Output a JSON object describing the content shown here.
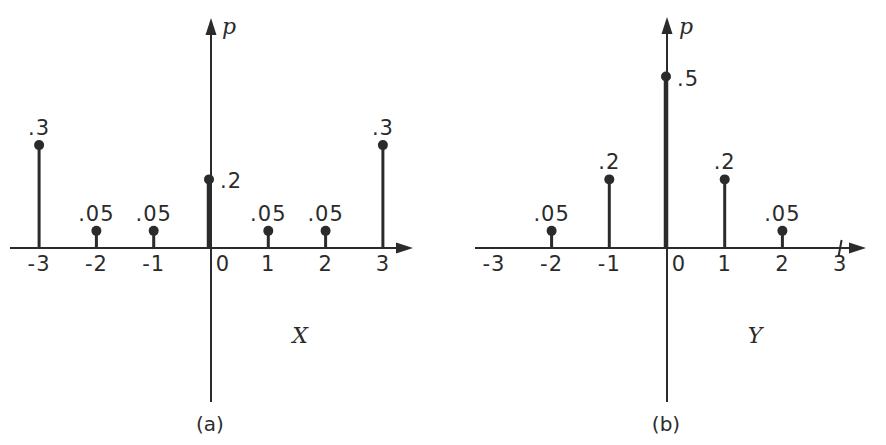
{
  "colors": {
    "ink": "#2b2b2b",
    "background": "#ffffff"
  },
  "chart_data": [
    {
      "type": "stem",
      "panel_caption": "(a)",
      "title": "",
      "xlabel": "X",
      "ylabel": "p",
      "x": [
        -3,
        -2,
        -1,
        0,
        1,
        2,
        3
      ],
      "p": [
        0.3,
        0.05,
        0.05,
        0.2,
        0.05,
        0.05,
        0.3
      ],
      "point_labels": [
        ".3",
        ".05",
        ".05",
        ".2",
        ".05",
        ".05",
        ".3"
      ],
      "x_tick_labels": [
        "-3",
        "-2",
        "-1",
        "0",
        "1",
        "2",
        "3"
      ],
      "xlim": [
        -3.6,
        3.6
      ],
      "ylim": [
        0,
        0.67
      ],
      "grid": false,
      "legend": "none",
      "extra_axis_ticks": []
    },
    {
      "type": "stem",
      "panel_caption": "(b)",
      "title": "",
      "xlabel": "Y",
      "ylabel": "p",
      "x": [
        -2,
        -1,
        0,
        1,
        2
      ],
      "p": [
        0.05,
        0.2,
        0.5,
        0.2,
        0.05
      ],
      "point_labels": [
        ".05",
        ".2",
        ".5",
        ".2",
        ".05"
      ],
      "x_tick_labels": [
        "-3",
        "-2",
        "-1",
        "0",
        "1",
        "2",
        "3"
      ],
      "xlim": [
        -3.4,
        3.6
      ],
      "ylim": [
        0,
        0.67
      ],
      "grid": false,
      "legend": "none",
      "extra_axis_ticks": [
        3
      ]
    }
  ]
}
